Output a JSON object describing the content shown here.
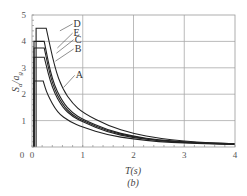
{
  "chart_data": {
    "type": "line",
    "title": "",
    "subtitle": "(b)",
    "xlabel": "T(s)",
    "ylabel": "Sa/ag",
    "xlim": [
      0,
      4
    ],
    "ylim": [
      0,
      5
    ],
    "x_ticks": [
      "0",
      "1",
      "2",
      "3",
      "4"
    ],
    "y_ticks": [
      "0",
      "1",
      "2",
      "3",
      "4",
      "5"
    ],
    "grid": true,
    "legend": "inline labels",
    "series": [
      {
        "name": "A",
        "points": [
          [
            0.0,
            0.0
          ],
          [
            0.04,
            2.5
          ],
          [
            0.22,
            2.5
          ],
          [
            0.3,
            2.0
          ],
          [
            0.5,
            1.3
          ],
          [
            0.75,
            0.95
          ],
          [
            1.0,
            0.75
          ],
          [
            1.5,
            0.45
          ],
          [
            2.0,
            0.3
          ],
          [
            2.5,
            0.2
          ],
          [
            3.0,
            0.15
          ],
          [
            3.5,
            0.12
          ],
          [
            4.0,
            0.1
          ]
        ]
      },
      {
        "name": "B",
        "points": [
          [
            0.0,
            0.0
          ],
          [
            0.04,
            3.4
          ],
          [
            0.24,
            3.4
          ],
          [
            0.4,
            2.2
          ],
          [
            0.6,
            1.5
          ],
          [
            0.8,
            1.15
          ],
          [
            1.0,
            0.95
          ],
          [
            1.5,
            0.55
          ],
          [
            2.0,
            0.35
          ],
          [
            2.5,
            0.23
          ],
          [
            3.0,
            0.17
          ],
          [
            3.5,
            0.13
          ],
          [
            4.0,
            0.1
          ]
        ]
      },
      {
        "name": "C",
        "points": [
          [
            0.0,
            0.0
          ],
          [
            0.04,
            3.75
          ],
          [
            0.24,
            3.75
          ],
          [
            0.4,
            2.35
          ],
          [
            0.6,
            1.6
          ],
          [
            0.8,
            1.2
          ],
          [
            1.0,
            1.0
          ],
          [
            1.5,
            0.6
          ],
          [
            2.0,
            0.38
          ],
          [
            2.5,
            0.25
          ],
          [
            3.0,
            0.18
          ],
          [
            3.5,
            0.14
          ],
          [
            4.0,
            0.11
          ]
        ]
      },
      {
        "name": "E",
        "points": [
          [
            0.0,
            0.0
          ],
          [
            0.04,
            4.0
          ],
          [
            0.24,
            4.0
          ],
          [
            0.4,
            2.5
          ],
          [
            0.6,
            1.7
          ],
          [
            0.8,
            1.28
          ],
          [
            1.0,
            1.05
          ],
          [
            1.5,
            0.63
          ],
          [
            2.0,
            0.4
          ],
          [
            2.5,
            0.27
          ],
          [
            3.0,
            0.19
          ],
          [
            3.5,
            0.15
          ],
          [
            4.0,
            0.12
          ]
        ]
      },
      {
        "name": "D",
        "points": [
          [
            0.0,
            0.0
          ],
          [
            0.08,
            4.5
          ],
          [
            0.28,
            4.5
          ],
          [
            0.45,
            3.0
          ],
          [
            0.6,
            2.2
          ],
          [
            0.8,
            1.65
          ],
          [
            1.0,
            1.3
          ],
          [
            1.5,
            0.8
          ],
          [
            2.0,
            0.5
          ],
          [
            2.5,
            0.33
          ],
          [
            3.0,
            0.22
          ],
          [
            3.5,
            0.16
          ],
          [
            4.0,
            0.12
          ]
        ]
      }
    ],
    "labels": [
      {
        "name": "D",
        "x": 0.82,
        "y": 4.55,
        "anchor_x": 0.55,
        "anchor_y": 4.4
      },
      {
        "name": "E",
        "x": 0.82,
        "y": 4.2,
        "anchor_x": 0.5,
        "anchor_y": 3.75
      },
      {
        "name": "C",
        "x": 0.84,
        "y": 3.95,
        "anchor_x": 0.48,
        "anchor_y": 3.55
      },
      {
        "name": "B",
        "x": 0.84,
        "y": 3.6,
        "anchor_x": 0.46,
        "anchor_y": 3.25
      },
      {
        "name": "A",
        "x": 0.86,
        "y": 2.6,
        "anchor_x": 0.62,
        "anchor_y": 2.25
      }
    ]
  },
  "axis": {
    "ylabel_main": "S",
    "ylabel_sub1": "a",
    "ylabel_mid": "/a",
    "ylabel_sub2": "g",
    "xlabel": "T(s)",
    "subtitle": "(b)"
  }
}
